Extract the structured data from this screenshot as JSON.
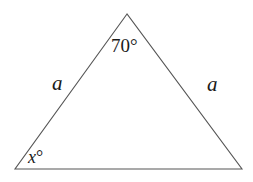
{
  "diagram": {
    "type": "isosceles-triangle",
    "stroke_color": "#555555",
    "text_color": "#1a1a1a",
    "vertices": {
      "apex": [
        127,
        14
      ],
      "bottom_left": [
        15,
        169
      ],
      "bottom_right": [
        242,
        169
      ]
    },
    "labels": {
      "apex_angle": "70°",
      "left_side": "a",
      "right_side": "a",
      "base_angle": "x°"
    }
  }
}
